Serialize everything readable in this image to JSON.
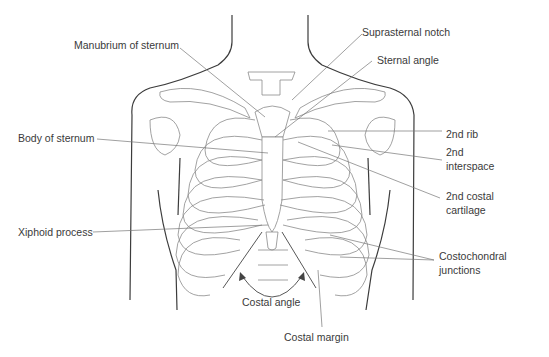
{
  "figure": {
    "labels": {
      "manubrium": "Manubrium of sternum",
      "suprasternal_notch": "Suprasternal notch",
      "sternal_angle": "Sternal angle",
      "body_of_sternum": "Body of sternum",
      "second_rib": "2nd rib",
      "second_interspace_1": "2nd",
      "second_interspace_2": "interspace",
      "second_costal_cartilage_1": "2nd costal",
      "second_costal_cartilage_2": "cartilage",
      "xiphoid_process": "Xiphoid process",
      "costochondral_1": "Costochondral",
      "costochondral_2": "junctions",
      "costal_angle": "Costal angle",
      "costal_margin": "Costal margin"
    }
  }
}
